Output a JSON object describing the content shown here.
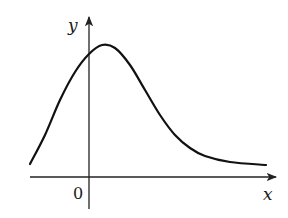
{
  "chart_data": {
    "type": "line",
    "title": "",
    "xlabel": "x",
    "ylabel": "y",
    "origin_label": "0",
    "grid": false,
    "legend": null,
    "axes": {
      "x_axis": {
        "arrow": true,
        "y_pixel": 177,
        "x_start": 30,
        "x_end": 276
      },
      "y_axis": {
        "arrow": true,
        "x_pixel": 89,
        "y_top": 18,
        "y_bottom": 209
      }
    },
    "curve_pixels": [
      [
        30,
        164
      ],
      [
        45,
        135
      ],
      [
        60,
        100
      ],
      [
        75,
        72
      ],
      [
        89,
        54
      ],
      [
        102,
        45
      ],
      [
        115,
        48
      ],
      [
        130,
        65
      ],
      [
        145,
        90
      ],
      [
        160,
        115
      ],
      [
        175,
        135
      ],
      [
        190,
        148
      ],
      [
        205,
        156
      ],
      [
        230,
        162
      ],
      [
        266,
        165
      ]
    ],
    "features": {
      "maximum": {
        "x_pixel": 103,
        "y_pixel": 44,
        "note": "peak just right of y-axis"
      },
      "y_intercept": {
        "x_pixel": 89,
        "y_pixel": 54
      },
      "horizontal_asymptote": "curve levels off above x-axis as x increases"
    },
    "colors": {
      "curve": "#111111",
      "axes": "#222222",
      "background": "#ffffff"
    }
  }
}
